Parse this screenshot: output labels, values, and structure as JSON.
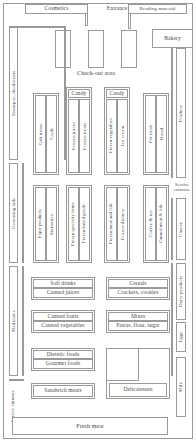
{
  "diagram": {
    "type": "floor-plan",
    "stroke_color": "#9a9a9a",
    "text_color": "#4a4a4a",
    "background": "#ffffff"
  },
  "top": {
    "cosmetics": "Cosmetics",
    "entrance": "Entrance",
    "reading_material": "Reading material",
    "bakery": "Bakery",
    "checkout_area": "Check-out area"
  },
  "left": {
    "shampoo_deodorants": "Shampoo, deodorants",
    "grooming_aids": "Grooming aids",
    "medicines": "Medicines",
    "service_entrance": "Service entrance"
  },
  "right": {
    "produce": "Produce",
    "service_entrance": "Service entrance",
    "cheese": "Cheese",
    "dairy_products": "Dairy products",
    "eggs": "Eggs",
    "milk": "Milk"
  },
  "bottom": {
    "fresh_meat": "Fresh meat"
  },
  "aisles": {
    "row1": [
      {
        "header": "",
        "left": "Gift items",
        "right": "Cards"
      },
      {
        "header": "Candy",
        "left": "Frozen juices",
        "right": "Frozen treats"
      },
      {
        "header": "Candy",
        "left": "Frozen vegetables",
        "right": "Ice cream"
      },
      {
        "header": "",
        "left": "Pet food",
        "right": "Bread"
      }
    ],
    "row2": [
      {
        "header": "",
        "left": "Paper products",
        "right": "Stationery"
      },
      {
        "header": "",
        "left": "Frozen specialty items",
        "right": "Frozen baked goods"
      },
      {
        "header": "",
        "left": "Frozen meat and fish",
        "right": "Frozen dinners"
      },
      {
        "header": "",
        "left": "Coffee & tea",
        "right": "Canned meat & fish"
      }
    ]
  },
  "gondolas": {
    "block1": {
      "top": "Soft drinks",
      "bottom": "Canned juices"
    },
    "block2": {
      "top": "Cereals",
      "bottom": "Crackers, cookies"
    },
    "block3": {
      "top": "Canned fruits",
      "bottom": "Canned vegetables"
    },
    "block4": {
      "top": "Mixes",
      "bottom": "Pastas, flour, sugar"
    },
    "block5": {
      "top": "Dietetic foods",
      "bottom": "Gourmet foods"
    },
    "block6": {
      "label": "Sandwich meats"
    },
    "block7": {
      "label": "Delicatessen"
    }
  }
}
